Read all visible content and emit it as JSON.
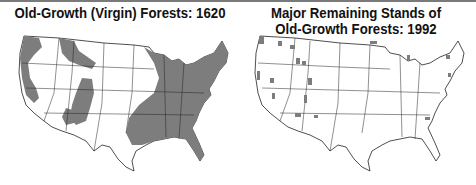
{
  "maps": [
    {
      "title": "Old-Growth (Virgin) Forests: 1620",
      "region": "Contiguous United States",
      "shading": "Old-growth forest extent (gray)",
      "forest_color": "#7d7d7d"
    },
    {
      "title_line1": "Major Remaining Stands of",
      "title_line2": "Old-Growth Forests: 1992",
      "region": "Contiguous United States",
      "shading": "Remaining old-growth stands (small gray patches)",
      "forest_color": "#7d7d7d"
    }
  ]
}
